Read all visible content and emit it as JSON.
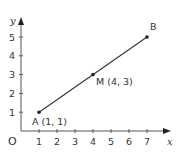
{
  "chart_data": {
    "type": "line",
    "title": "",
    "xlabel": "x",
    "ylabel": "y",
    "origin_label": "O",
    "xlim": [
      0,
      7.5
    ],
    "ylim": [
      0,
      5.5
    ],
    "x_ticks": [
      1,
      2,
      3,
      4,
      5,
      6,
      7
    ],
    "y_ticks": [
      1,
      2,
      3,
      4,
      5
    ],
    "x_tick_labels": [
      "1",
      "2",
      "3",
      "4",
      "5",
      "6",
      "7"
    ],
    "y_tick_labels": [
      "1",
      "2",
      "3",
      "4",
      "5"
    ],
    "grid": false,
    "series": [
      {
        "name": "AB",
        "x": [
          1,
          4,
          7
        ],
        "y": [
          1,
          3,
          5
        ]
      }
    ],
    "points": [
      {
        "name": "A",
        "x": 1,
        "y": 1,
        "label": "A (1, 1)"
      },
      {
        "name": "M",
        "x": 4,
        "y": 3,
        "label": "M (4, 3)"
      },
      {
        "name": "B",
        "x": 7,
        "y": 5,
        "label": "B"
      }
    ]
  },
  "colors": {
    "line": "#333333",
    "axes": "#555555",
    "text": "#333333"
  }
}
